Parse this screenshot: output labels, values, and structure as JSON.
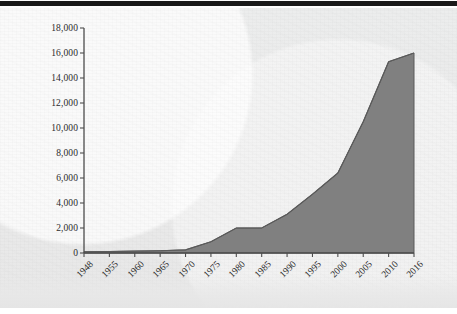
{
  "page": {
    "background_color": "#eaeaea",
    "top_rule_color": "#1a1a1a"
  },
  "chart_data": {
    "type": "area",
    "title": "",
    "subtitle": "",
    "xlabel": "",
    "ylabel": "",
    "categories": [
      "1948",
      "1955",
      "1960",
      "1965",
      "1970",
      "1975",
      "1980",
      "1985",
      "1990",
      "1995",
      "2000",
      "2005",
      "2010",
      "2016"
    ],
    "values": [
      100,
      120,
      150,
      180,
      250,
      900,
      2000,
      2000,
      3100,
      4700,
      6400,
      10500,
      15300,
      16000
    ],
    "series": [
      {
        "name": "Total",
        "values": [
          100,
          120,
          150,
          180,
          250,
          900,
          2000,
          2000,
          3100,
          4700,
          6400,
          10500,
          15300,
          16000
        ]
      }
    ],
    "ylim": [
      0,
      18000
    ],
    "ytick_values": [
      0,
      2000,
      4000,
      6000,
      8000,
      10000,
      12000,
      14000,
      16000,
      18000
    ],
    "ytick_labels": [
      "0",
      "2,000",
      "4,000",
      "6,000",
      "8,000",
      "10,000",
      "12,000",
      "14,000",
      "16,000",
      "18,000"
    ],
    "xtick_labels": [
      "1948",
      "1955",
      "1960",
      "1965",
      "1970",
      "1975",
      "1980",
      "1985",
      "1990",
      "1995",
      "2000",
      "2005",
      "2010",
      "2016"
    ],
    "xtick_rotation_deg": -45,
    "grid": false,
    "legend": false,
    "legend_position": "none",
    "area_fill_color": "#808080",
    "area_line_color": "#5a5a5a",
    "axis_color": "#4d4d4d",
    "tick_label_color": "#2b2b2b",
    "annotations": []
  }
}
